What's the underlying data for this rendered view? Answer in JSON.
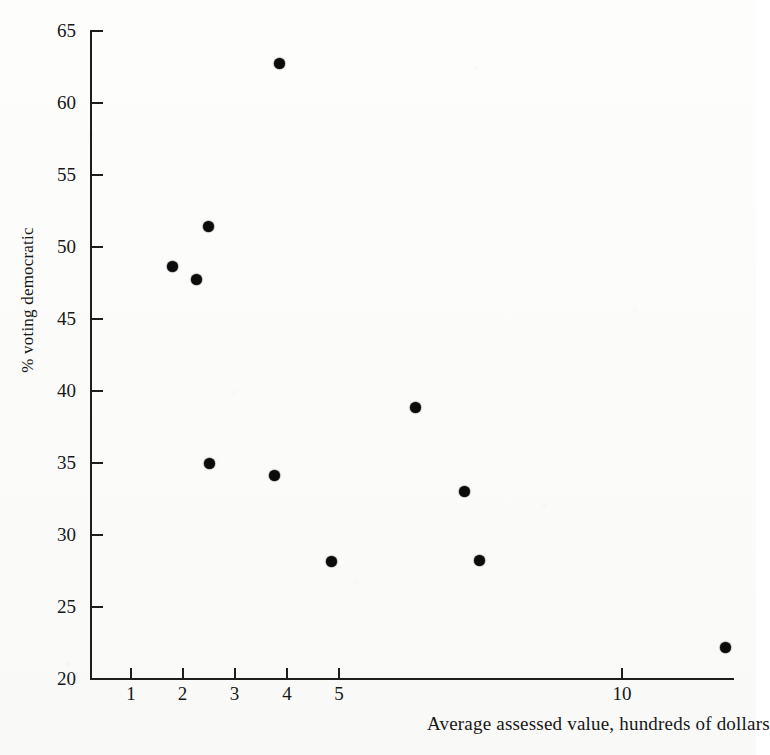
{
  "chart_data": {
    "type": "scatter",
    "title": "",
    "xlabel": "Average assessed value, hundreds of dollars",
    "ylabel": "% voting democratic",
    "xscale": "custom-compressed",
    "yscale": "linear",
    "xlim": [
      0.6,
      14.5
    ],
    "ylim": [
      20,
      65
    ],
    "grid": false,
    "legend": null,
    "xticks": [
      {
        "label": "1",
        "value": 1,
        "px": 131
      },
      {
        "label": "2",
        "value": 2,
        "px": 182.5
      },
      {
        "label": "3",
        "value": 3,
        "px": 234.5
      },
      {
        "label": "4",
        "value": 4,
        "px": 287
      },
      {
        "label": "5",
        "value": 5,
        "px": 339
      },
      {
        "label": "10",
        "value": 10,
        "px": 622
      }
    ],
    "yticks": [
      {
        "label": "65",
        "value": 65,
        "px": 31
      },
      {
        "label": "60",
        "value": 60,
        "px": 103
      },
      {
        "label": "55",
        "value": 55,
        "px": 175
      },
      {
        "label": "50",
        "value": 50,
        "px": 247
      },
      {
        "label": "45",
        "value": 45,
        "px": 319
      },
      {
        "label": "40",
        "value": 40,
        "px": 391
      },
      {
        "label": "35",
        "value": 35,
        "px": 463
      },
      {
        "label": "30",
        "value": 30,
        "px": 535
      },
      {
        "label": "25",
        "value": 25,
        "px": 607
      },
      {
        "label": "20",
        "value": 20,
        "px": 679
      }
    ],
    "points": [
      {
        "x": 3.85,
        "y": 62.8,
        "px": 279,
        "py": 63
      },
      {
        "x": 2.5,
        "y": 51.4,
        "px": 208,
        "py": 226
      },
      {
        "x": 1.8,
        "y": 48.7,
        "px": 172,
        "py": 266
      },
      {
        "x": 2.25,
        "y": 47.8,
        "px": 196,
        "py": 279
      },
      {
        "x": 6.5,
        "y": 38.8,
        "px": 415,
        "py": 407
      },
      {
        "x": 2.5,
        "y": 35.0,
        "px": 209,
        "py": 463
      },
      {
        "x": 3.75,
        "y": 34.2,
        "px": 274,
        "py": 475
      },
      {
        "x": 7.4,
        "y": 33.2,
        "px": 464,
        "py": 491
      },
      {
        "x": 7.7,
        "y": 28.4,
        "px": 479,
        "py": 560
      },
      {
        "x": 4.85,
        "y": 28.3,
        "px": 331,
        "py": 561
      },
      {
        "x": 14.0,
        "y": 22.4,
        "px": 725,
        "py": 647
      }
    ]
  }
}
